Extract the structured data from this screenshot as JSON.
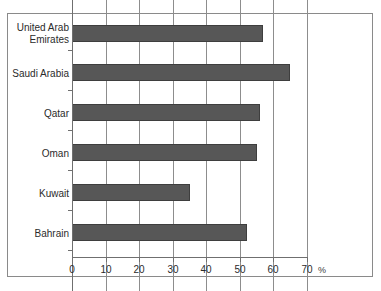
{
  "chart_data": {
    "type": "bar",
    "orientation": "horizontal",
    "title": "",
    "subtitle": "",
    "xlabel": "%",
    "ylabel": "",
    "categories": [
      "United Arab Emirates",
      "Saudi Arabia",
      "Qatar",
      "Oman",
      "Kuwait",
      "Bahrain"
    ],
    "values": [
      57,
      65,
      56,
      55,
      35,
      52
    ],
    "xlim": [
      0,
      70
    ],
    "xticks": [
      0,
      10,
      20,
      30,
      40,
      50,
      60,
      70
    ],
    "xtick_labels": [
      "0",
      "10",
      "20",
      "30",
      "40",
      "50",
      "60",
      "70"
    ],
    "grid": "vertical",
    "legend": "none",
    "bar_color": "#575757",
    "bar_edge_color": "#3e3e3e",
    "grid_color": "#8d8d8d",
    "axis_color": "#6f6f6f",
    "frame_color": "#8a8a8a",
    "background": "#ffffff",
    "annotations": []
  },
  "axis": {
    "unit_symbol": "%"
  },
  "categories": [
    {
      "label": "United Arab\nEmirates",
      "value": 57
    },
    {
      "label": "Saudi Arabia",
      "value": 65
    },
    {
      "label": "Qatar",
      "value": 56
    },
    {
      "label": "Oman",
      "value": 55
    },
    {
      "label": "Kuwait",
      "value": 35
    },
    {
      "label": "Bahrain",
      "value": 52
    }
  ],
  "xticks": [
    {
      "label": "0"
    },
    {
      "label": "10"
    },
    {
      "label": "20"
    },
    {
      "label": "30"
    },
    {
      "label": "40"
    },
    {
      "label": "50"
    },
    {
      "label": "60"
    },
    {
      "label": "70"
    }
  ]
}
